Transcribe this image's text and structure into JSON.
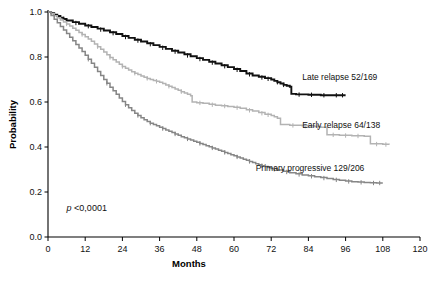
{
  "chart_data": {
    "type": "line",
    "subtype": "kaplan-meier-survival",
    "title": "",
    "xlabel": "Months",
    "ylabel": "Probability",
    "xlim": [
      0,
      120
    ],
    "ylim": [
      0,
      1.0
    ],
    "xticks": [
      0,
      12,
      24,
      36,
      48,
      60,
      72,
      84,
      96,
      108,
      120
    ],
    "xtick_labels": [
      "0",
      "12",
      "24",
      "36",
      "48",
      "60",
      "72",
      "84",
      "96",
      "108",
      "120"
    ],
    "yticks": [
      0.0,
      0.2,
      0.4,
      0.6,
      0.8,
      1.0
    ],
    "ytick_labels": [
      "0.0",
      "0.2",
      "0.4",
      "0.6",
      "0.8",
      "1.0"
    ],
    "grid": false,
    "legend_position": "inline-right-of-curve-end",
    "annotations": [
      {
        "name": "p-value",
        "text_italic": "p",
        "text_rest": " <0,0001",
        "full_text": "p <0,0001",
        "x": 6,
        "y": 0.115
      }
    ],
    "series": [
      {
        "name": "Late relapse 52/169",
        "label": "Late relapse 52/169",
        "color": "#111111",
        "linewidth": 1.9,
        "label_x": 82,
        "label_y": 0.7,
        "points": [
          [
            0,
            1.0
          ],
          [
            1,
            0.995
          ],
          [
            2,
            0.988
          ],
          [
            3,
            0.982
          ],
          [
            4,
            0.975
          ],
          [
            5,
            0.969
          ],
          [
            6,
            0.962
          ],
          [
            8,
            0.955
          ],
          [
            10,
            0.948
          ],
          [
            12,
            0.94
          ],
          [
            14,
            0.933
          ],
          [
            16,
            0.926
          ],
          [
            18,
            0.918
          ],
          [
            20,
            0.91
          ],
          [
            22,
            0.902
          ],
          [
            24,
            0.893
          ],
          [
            26,
            0.885
          ],
          [
            28,
            0.877
          ],
          [
            30,
            0.869
          ],
          [
            32,
            0.861
          ],
          [
            34,
            0.853
          ],
          [
            36,
            0.845
          ],
          [
            38,
            0.836
          ],
          [
            40,
            0.828
          ],
          [
            42,
            0.82
          ],
          [
            44,
            0.812
          ],
          [
            46,
            0.803
          ],
          [
            48,
            0.795
          ],
          [
            50,
            0.787
          ],
          [
            52,
            0.779
          ],
          [
            54,
            0.771
          ],
          [
            56,
            0.763
          ],
          [
            58,
            0.755
          ],
          [
            60,
            0.747
          ],
          [
            62,
            0.738
          ],
          [
            64,
            0.727
          ],
          [
            66,
            0.718
          ],
          [
            68,
            0.712
          ],
          [
            70,
            0.706
          ],
          [
            72,
            0.7
          ],
          [
            73,
            0.694
          ],
          [
            74,
            0.688
          ],
          [
            75,
            0.682
          ],
          [
            76,
            0.676
          ],
          [
            77,
            0.672
          ],
          [
            78,
            0.668
          ],
          [
            78.5,
            0.636
          ],
          [
            80,
            0.634
          ],
          [
            84,
            0.632
          ],
          [
            88,
            0.63
          ],
          [
            92,
            0.63
          ],
          [
            96,
            0.63
          ]
        ],
        "censor_marks": [
          [
            5,
            0.969
          ],
          [
            9,
            0.951
          ],
          [
            13,
            0.937
          ],
          [
            17,
            0.922
          ],
          [
            21,
            0.906
          ],
          [
            25,
            0.889
          ],
          [
            29,
            0.873
          ],
          [
            33,
            0.857
          ],
          [
            37,
            0.841
          ],
          [
            41,
            0.824
          ],
          [
            45,
            0.807
          ],
          [
            49,
            0.791
          ],
          [
            53,
            0.775
          ],
          [
            57,
            0.759
          ],
          [
            61,
            0.743
          ],
          [
            65,
            0.723
          ],
          [
            69,
            0.709
          ],
          [
            71,
            0.703
          ],
          [
            74,
            0.688
          ],
          [
            76,
            0.676
          ],
          [
            81,
            0.633
          ],
          [
            85,
            0.632
          ],
          [
            89,
            0.63
          ],
          [
            93,
            0.63
          ],
          [
            95,
            0.63
          ]
        ]
      },
      {
        "name": "Early relapse 64/138",
        "label": "Early relapse 64/138",
        "color": "#b3b3b3",
        "linewidth": 1.5,
        "label_x": 82,
        "label_y": 0.485,
        "points": [
          [
            0,
            1.0
          ],
          [
            1,
            0.992
          ],
          [
            2,
            0.983
          ],
          [
            3,
            0.974
          ],
          [
            4,
            0.965
          ],
          [
            5,
            0.956
          ],
          [
            6,
            0.947
          ],
          [
            7,
            0.938
          ],
          [
            8,
            0.928
          ],
          [
            9,
            0.919
          ],
          [
            10,
            0.909
          ],
          [
            11,
            0.9
          ],
          [
            12,
            0.89
          ],
          [
            13,
            0.88
          ],
          [
            14,
            0.87
          ],
          [
            15,
            0.858
          ],
          [
            16,
            0.846
          ],
          [
            17,
            0.834
          ],
          [
            18,
            0.822
          ],
          [
            19,
            0.81
          ],
          [
            20,
            0.798
          ],
          [
            21,
            0.788
          ],
          [
            22,
            0.778
          ],
          [
            23,
            0.768
          ],
          [
            24,
            0.758
          ],
          [
            25,
            0.75
          ],
          [
            26,
            0.742
          ],
          [
            27,
            0.735
          ],
          [
            28,
            0.728
          ],
          [
            29,
            0.722
          ],
          [
            30,
            0.716
          ],
          [
            31,
            0.71
          ],
          [
            32,
            0.705
          ],
          [
            33,
            0.7
          ],
          [
            34,
            0.696
          ],
          [
            35,
            0.692
          ],
          [
            36,
            0.688
          ],
          [
            37,
            0.682
          ],
          [
            38,
            0.676
          ],
          [
            39,
            0.67
          ],
          [
            40,
            0.664
          ],
          [
            41,
            0.658
          ],
          [
            42,
            0.652
          ],
          [
            43,
            0.646
          ],
          [
            44,
            0.64
          ],
          [
            45,
            0.634
          ],
          [
            46,
            0.628
          ],
          [
            46.5,
            0.6
          ],
          [
            48,
            0.597
          ],
          [
            50,
            0.594
          ],
          [
            52,
            0.59
          ],
          [
            54,
            0.586
          ],
          [
            56,
            0.583
          ],
          [
            58,
            0.58
          ],
          [
            60,
            0.577
          ],
          [
            62,
            0.572
          ],
          [
            64,
            0.566
          ],
          [
            66,
            0.56
          ],
          [
            68,
            0.553
          ],
          [
            70,
            0.546
          ],
          [
            72,
            0.54
          ],
          [
            73,
            0.534
          ],
          [
            74,
            0.528
          ],
          [
            75,
            0.5
          ],
          [
            78,
            0.497
          ],
          [
            82,
            0.494
          ],
          [
            86,
            0.491
          ],
          [
            88,
            0.488
          ],
          [
            90,
            0.455
          ],
          [
            94,
            0.452
          ],
          [
            98,
            0.45
          ],
          [
            102,
            0.448
          ],
          [
            104,
            0.414
          ],
          [
            108,
            0.412
          ],
          [
            110,
            0.41
          ]
        ],
        "censor_marks": [
          [
            6,
            0.947
          ],
          [
            11,
            0.9
          ],
          [
            16,
            0.846
          ],
          [
            20,
            0.798
          ],
          [
            24,
            0.758
          ],
          [
            28,
            0.728
          ],
          [
            32,
            0.705
          ],
          [
            35,
            0.692
          ],
          [
            39,
            0.67
          ],
          [
            43,
            0.646
          ],
          [
            49,
            0.596
          ],
          [
            53,
            0.588
          ],
          [
            57,
            0.582
          ],
          [
            61,
            0.575
          ],
          [
            65,
            0.563
          ],
          [
            69,
            0.55
          ],
          [
            71,
            0.543
          ],
          [
            79,
            0.496
          ],
          [
            83,
            0.493
          ],
          [
            87,
            0.49
          ],
          [
            92,
            0.454
          ],
          [
            96,
            0.451
          ],
          [
            100,
            0.449
          ],
          [
            106,
            0.413
          ],
          [
            109,
            0.411
          ]
        ]
      },
      {
        "name": "Primary progressive 129/206",
        "label": "Primary progressive 129/206",
        "color": "#868686",
        "linewidth": 1.5,
        "label_x": 67,
        "label_y": 0.295,
        "points": [
          [
            0,
            1.0
          ],
          [
            1,
            0.984
          ],
          [
            2,
            0.968
          ],
          [
            3,
            0.952
          ],
          [
            4,
            0.936
          ],
          [
            5,
            0.92
          ],
          [
            6,
            0.904
          ],
          [
            7,
            0.888
          ],
          [
            8,
            0.872
          ],
          [
            9,
            0.856
          ],
          [
            10,
            0.84
          ],
          [
            11,
            0.824
          ],
          [
            12,
            0.808
          ],
          [
            13,
            0.79
          ],
          [
            14,
            0.772
          ],
          [
            15,
            0.754
          ],
          [
            16,
            0.736
          ],
          [
            17,
            0.718
          ],
          [
            18,
            0.7
          ],
          [
            19,
            0.683
          ],
          [
            20,
            0.666
          ],
          [
            21,
            0.65
          ],
          [
            22,
            0.634
          ],
          [
            23,
            0.618
          ],
          [
            24,
            0.602
          ],
          [
            25,
            0.588
          ],
          [
            26,
            0.574
          ],
          [
            27,
            0.562
          ],
          [
            28,
            0.55
          ],
          [
            29,
            0.54
          ],
          [
            30,
            0.53
          ],
          [
            31,
            0.521
          ],
          [
            32,
            0.513
          ],
          [
            33,
            0.506
          ],
          [
            34,
            0.5
          ],
          [
            35,
            0.494
          ],
          [
            36,
            0.488
          ],
          [
            37,
            0.482
          ],
          [
            38,
            0.476
          ],
          [
            39,
            0.47
          ],
          [
            40,
            0.464
          ],
          [
            41,
            0.458
          ],
          [
            42,
            0.452
          ],
          [
            43,
            0.446
          ],
          [
            44,
            0.441
          ],
          [
            45,
            0.436
          ],
          [
            46,
            0.431
          ],
          [
            47,
            0.426
          ],
          [
            48,
            0.421
          ],
          [
            49,
            0.416
          ],
          [
            50,
            0.411
          ],
          [
            51,
            0.406
          ],
          [
            52,
            0.401
          ],
          [
            53,
            0.396
          ],
          [
            54,
            0.391
          ],
          [
            55,
            0.386
          ],
          [
            56,
            0.381
          ],
          [
            57,
            0.376
          ],
          [
            58,
            0.371
          ],
          [
            59,
            0.366
          ],
          [
            60,
            0.361
          ],
          [
            61,
            0.356
          ],
          [
            62,
            0.351
          ],
          [
            63,
            0.346
          ],
          [
            64,
            0.341
          ],
          [
            65,
            0.336
          ],
          [
            66,
            0.331
          ],
          [
            67,
            0.326
          ],
          [
            68,
            0.321
          ],
          [
            69,
            0.317
          ],
          [
            70,
            0.313
          ],
          [
            71,
            0.309
          ],
          [
            72,
            0.305
          ],
          [
            74,
            0.298
          ],
          [
            76,
            0.292
          ],
          [
            78,
            0.286
          ],
          [
            80,
            0.281
          ],
          [
            82,
            0.276
          ],
          [
            84,
            0.272
          ],
          [
            86,
            0.268
          ],
          [
            88,
            0.264
          ],
          [
            90,
            0.26
          ],
          [
            92,
            0.256
          ],
          [
            94,
            0.252
          ],
          [
            96,
            0.249
          ],
          [
            98,
            0.246
          ],
          [
            100,
            0.244
          ],
          [
            102,
            0.242
          ],
          [
            104,
            0.241
          ],
          [
            106,
            0.24
          ],
          [
            108,
            0.24
          ]
        ],
        "censor_marks": [
          [
            13,
            0.79
          ],
          [
            19,
            0.683
          ],
          [
            25,
            0.588
          ],
          [
            29,
            0.54
          ],
          [
            33,
            0.506
          ],
          [
            37,
            0.482
          ],
          [
            41,
            0.458
          ],
          [
            45,
            0.436
          ],
          [
            49,
            0.416
          ],
          [
            53,
            0.396
          ],
          [
            57,
            0.376
          ],
          [
            61,
            0.356
          ],
          [
            65,
            0.336
          ],
          [
            69,
            0.317
          ],
          [
            73,
            0.301
          ],
          [
            77,
            0.289
          ],
          [
            81,
            0.278
          ],
          [
            85,
            0.27
          ],
          [
            89,
            0.262
          ],
          [
            93,
            0.254
          ],
          [
            97,
            0.247
          ],
          [
            101,
            0.243
          ],
          [
            105,
            0.24
          ],
          [
            107,
            0.24
          ]
        ]
      }
    ]
  },
  "geometry": {
    "x0_px": 48,
    "x1_px": 420,
    "y0_px": 237,
    "y1_px": 12
  }
}
